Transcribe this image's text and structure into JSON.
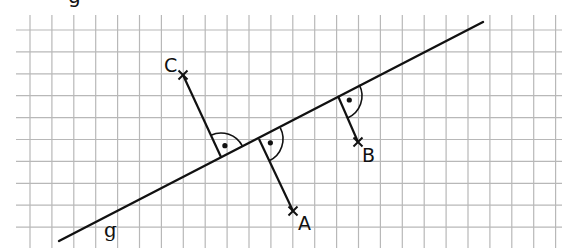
{
  "diagram": {
    "type": "geometry-perpendiculars",
    "grid": {
      "spacing": 21.9,
      "origin_x": 30,
      "origin_y": 30,
      "x_min": 16,
      "x_max": 562,
      "y_min": 15,
      "y_max": 248,
      "color": "#b8b8b8"
    },
    "line_g": {
      "label": "g",
      "start": [
        59,
        241
      ],
      "end": [
        483,
        22
      ],
      "label_pos": [
        104,
        220
      ]
    },
    "points": [
      {
        "name": "C",
        "label": "C",
        "pos": [
          183,
          75
        ],
        "foot": [
          221,
          157
        ],
        "label_pos": [
          164,
          56
        ],
        "arc_side": "right"
      },
      {
        "name": "A",
        "label": "A",
        "pos": [
          293,
          211
        ],
        "foot": [
          259,
          139
        ],
        "label_pos": [
          298,
          214
        ],
        "arc_side": "right"
      },
      {
        "name": "B",
        "label": "B",
        "pos": [
          358,
          142
        ],
        "foot": [
          338,
          96
        ],
        "label_pos": [
          362,
          146
        ],
        "arc_side": "right"
      }
    ],
    "top_cropped_glyph": "g",
    "stroke_color": "#111111"
  }
}
